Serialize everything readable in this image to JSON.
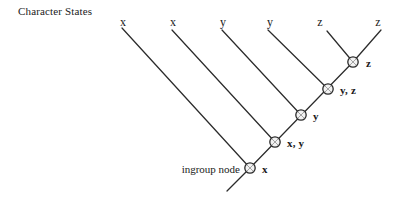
{
  "figure": {
    "caption": "Character States",
    "ingroup_annotation": "ingroup node",
    "background_color": "#ffffff",
    "line_color": "#2b2b2b",
    "node_fill_color": "#f2f2f2"
  },
  "tips": [
    {
      "label": "x",
      "x": 123,
      "y": 16
    },
    {
      "label": "x",
      "x": 173,
      "y": 16
    },
    {
      "label": "y",
      "x": 223,
      "y": 16
    },
    {
      "label": "y",
      "x": 270,
      "y": 16
    },
    {
      "label": "z",
      "x": 320,
      "y": 16
    },
    {
      "label": "z",
      "x": 378,
      "y": 16
    }
  ],
  "nodes": [
    {
      "label": "x",
      "cx": 250,
      "cy": 168,
      "lx": 262,
      "ly": 164
    },
    {
      "label": "x, y",
      "cx": 275,
      "cy": 142,
      "lx": 287,
      "ly": 138
    },
    {
      "label": "y",
      "cx": 301,
      "cy": 115,
      "lx": 313,
      "ly": 111
    },
    {
      "label": "y, z",
      "cx": 328,
      "cy": 89,
      "lx": 340,
      "ly": 85
    },
    {
      "label": "z",
      "cx": 353,
      "cy": 62,
      "lx": 366,
      "ly": 58
    }
  ],
  "branches": [
    {
      "name": "tip-branch-1",
      "x1": 122,
      "y1": 28,
      "x2": 250,
      "y2": 168
    },
    {
      "name": "tip-branch-2",
      "x1": 172,
      "y1": 30,
      "x2": 275,
      "y2": 142
    },
    {
      "name": "tip-branch-3",
      "x1": 222,
      "y1": 30,
      "x2": 301,
      "y2": 115
    },
    {
      "name": "tip-branch-4",
      "x1": 268,
      "y1": 30,
      "x2": 328,
      "y2": 89
    },
    {
      "name": "tip-branch-5",
      "x1": 327,
      "y1": 31,
      "x2": 353,
      "y2": 62
    },
    {
      "name": "tip-branch-6",
      "x1": 381,
      "y1": 30,
      "x2": 353,
      "y2": 62
    },
    {
      "name": "spine-branch",
      "x1": 250,
      "y1": 168,
      "x2": 353,
      "y2": 62
    },
    {
      "name": "root-branch",
      "x1": 250,
      "y1": 168,
      "x2": 227,
      "y2": 191
    }
  ],
  "annotation": {
    "x": 240,
    "y": 164
  }
}
